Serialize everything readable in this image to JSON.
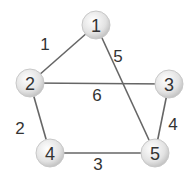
{
  "graph": {
    "nodes": [
      {
        "id": "1",
        "label": "1",
        "x": 96,
        "y": 25
      },
      {
        "id": "2",
        "label": "2",
        "x": 30,
        "y": 83
      },
      {
        "id": "3",
        "label": "3",
        "x": 169,
        "y": 84
      },
      {
        "id": "4",
        "label": "4",
        "x": 50,
        "y": 153
      },
      {
        "id": "5",
        "label": "5",
        "x": 155,
        "y": 153
      }
    ],
    "edges": [
      {
        "from": "1",
        "to": "2",
        "weight": "1",
        "lx": 45,
        "ly": 50
      },
      {
        "from": "1",
        "to": "5",
        "weight": "5",
        "lx": 118,
        "ly": 62
      },
      {
        "from": "2",
        "to": "3",
        "weight": "6",
        "lx": 97,
        "ly": 101
      },
      {
        "from": "2",
        "to": "4",
        "weight": "2",
        "lx": 20,
        "ly": 134
      },
      {
        "from": "3",
        "to": "5",
        "weight": "4",
        "lx": 173,
        "ly": 130
      },
      {
        "from": "4",
        "to": "5",
        "weight": "3",
        "lx": 98,
        "ly": 170
      }
    ]
  },
  "colors": {
    "edge": "#666666",
    "node_fill": "#e0e0e0",
    "node_stroke": "#c8c8c8",
    "text": "#333333"
  }
}
